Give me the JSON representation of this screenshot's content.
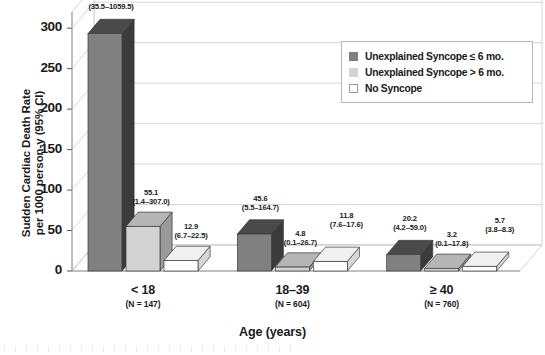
{
  "chart_data": {
    "type": "bar",
    "title": "",
    "subtitle": "",
    "xlabel": "Age (years)",
    "ylabel": "Sudden Cardiac Death Rate per 1000 person-y (95% CI)",
    "ylabel_line1": "Sudden Cardiac Death Rate",
    "ylabel_line2": "per 1000 person-y (95% CI)",
    "ylim": [
      0,
      320
    ],
    "yticks": [
      0,
      50,
      100,
      150,
      200,
      250,
      300
    ],
    "ytick_labels": [
      "0",
      "50",
      "100",
      "150",
      "200",
      "250",
      "300"
    ],
    "grid": true,
    "style": "3d-grouped-bar",
    "legend_position": "top-right",
    "categories": [
      "< 18",
      "18–39",
      "≥ 40"
    ],
    "category_n_labels": [
      "(N = 147)",
      "(N = 604)",
      "(N = 760)"
    ],
    "series": [
      {
        "name": "Unexplained Syncope ≤ 6 mo.",
        "color": "#808080",
        "side_color": "#3b3b3b",
        "top_color": "#4a4a4a",
        "values": [
          293.3,
          45.6,
          20.2
        ],
        "ci_low": [
          35.5,
          5.5,
          4.2
        ],
        "ci_high": [
          1059.5,
          164.7,
          59.0
        ],
        "labels": [
          "293.3",
          "45.6",
          "20.2"
        ],
        "ci_labels": [
          "(35.5–1059.5)",
          "(5.5–164.7)",
          "(4.2–59.0)"
        ]
      },
      {
        "name": "Unexplained Syncope > 6 mo.",
        "color": "#d3d3d3",
        "side_color": "#9a9a9a",
        "top_color": "#b5b5b5",
        "values": [
          55.1,
          4.8,
          3.2
        ],
        "ci_low": [
          1.4,
          0.1,
          0.1
        ],
        "ci_high": [
          307.0,
          26.7,
          17.8
        ],
        "labels": [
          "55.1",
          "4.8",
          "3.2"
        ],
        "ci_labels": [
          "(1.4–307.0)",
          "(0.1–26.7)",
          "(0.1–17.8)"
        ]
      },
      {
        "name": "No Syncope",
        "color": "#ffffff",
        "side_color": "#d8d8d8",
        "top_color": "#f0f0f0",
        "values": [
          12.9,
          11.8,
          5.7
        ],
        "ci_low": [
          6.7,
          7.6,
          3.8
        ],
        "ci_high": [
          22.5,
          17.6,
          8.3
        ],
        "labels": [
          "12.9",
          "11.8",
          "5.7"
        ],
        "ci_labels": [
          "(6.7–22.5)",
          "(7.6–17.6)",
          "(3.8–8.3)"
        ]
      }
    ]
  },
  "legend": {
    "items": [
      {
        "label": "Unexplained Syncope ≤ 6 mo.",
        "color": "#808080"
      },
      {
        "label": "Unexplained Syncope > 6 mo.",
        "color": "#d3d3d3"
      },
      {
        "label": "No Syncope",
        "color": "#ffffff"
      }
    ]
  }
}
